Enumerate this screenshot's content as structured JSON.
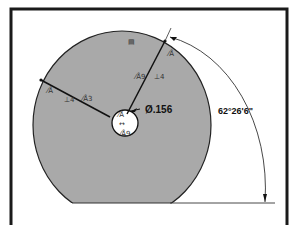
{
  "drawing": {
    "type": "cad-sketch",
    "colors": {
      "frame": "#1a1a1a",
      "part_fill": "#a9a9a9",
      "sketch_line": "#111111",
      "background": "#ffffff"
    },
    "dimensions": {
      "hole_diameter": "Ø.156",
      "angle": "62°26'6\""
    },
    "relations": {
      "top_marker": "▤",
      "arc_coincident": "⁄Å",
      "right_line_coincident": "⁄Å9",
      "right_line_perpendicular": "⊥4",
      "left_line_coincident_outer": "⁄Å",
      "left_line_perpendicular": "⊥4",
      "left_line_coincident": "⁄Å3",
      "center_marker": "⁄Å",
      "center_arrows": "↔",
      "hole_bottom": "⁄Å9"
    }
  }
}
